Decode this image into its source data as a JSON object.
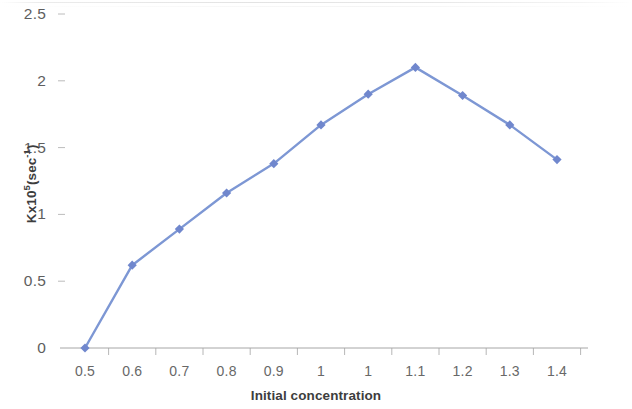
{
  "chart_data": {
    "type": "line",
    "title": "",
    "xlabel": "Initial concentration",
    "ylabel": "Kx10⁵(sec⁻¹)",
    "ylabel_parts": {
      "base": "Kx10",
      "exp": "5",
      "paren_open": "(sec",
      "exp2": "-1",
      "paren_close": ")"
    },
    "categories": [
      "0.5",
      "0.6",
      "0.7",
      "0.8",
      "0.9",
      "1",
      "1",
      "1.1",
      "1.2",
      "1.3",
      "1.4"
    ],
    "values": [
      0,
      0.62,
      0.89,
      1.16,
      1.38,
      1.67,
      1.9,
      2.1,
      1.89,
      1.67,
      1.41
    ],
    "series": [
      {
        "name": "K",
        "values": [
          0,
          0.62,
          0.89,
          1.16,
          1.38,
          1.67,
          1.9,
          2.1,
          1.89,
          1.67,
          1.41
        ]
      }
    ],
    "ylim": [
      0,
      2.5
    ],
    "yticks": [
      "0",
      "0.5",
      "1",
      "1.5",
      "2",
      "2.5"
    ],
    "ytick_values": [
      0,
      0.5,
      1,
      1.5,
      2,
      2.5
    ],
    "grid": false,
    "legend": "none",
    "marker": "diamond",
    "colors": {
      "series_line": "#7D97D4",
      "series_marker": "#7087CD",
      "axis": "#A6A6A6",
      "tick_text": "#686868",
      "title_text": "#3D3D3D"
    }
  }
}
